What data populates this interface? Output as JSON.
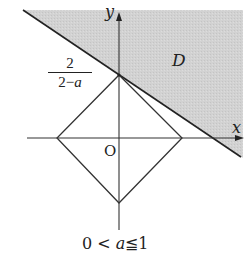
{
  "diagram": {
    "region_label": "D",
    "axis_x_label": "x",
    "axis_y_label": "y",
    "origin_label": "O",
    "intercept_label": {
      "numerator": "2",
      "denominator_prefix": "2−",
      "denominator_var": "a"
    },
    "condition": {
      "left": "0 <",
      "var": "a",
      "right": "≦1"
    },
    "colors": {
      "shade": "#d4d4d4",
      "line": "#222222",
      "background": "#ffffff"
    },
    "shapes": {
      "boundary_line": {
        "from": [
          23,
          10
        ],
        "through": [
          119,
          75
        ],
        "to": [
          241,
          157
        ]
      },
      "diamond": {
        "top": [
          119,
          75
        ],
        "right": [
          182,
          138
        ],
        "bottom": [
          119,
          203
        ],
        "left": [
          57,
          138
        ]
      },
      "x_axis": {
        "from": [
          27,
          138
        ],
        "to": [
          243,
          138
        ]
      },
      "y_axis": {
        "from": [
          119,
          230
        ],
        "to": [
          119,
          12
        ]
      }
    }
  }
}
